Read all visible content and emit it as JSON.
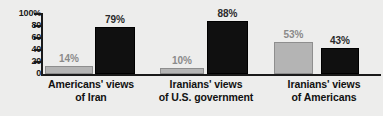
{
  "chart_data": {
    "type": "bar",
    "title": "",
    "subtitle": "",
    "xlabel": "",
    "ylabel": "",
    "ylim": [
      0,
      100
    ],
    "grid": false,
    "legend_position": "none",
    "categories": [
      "Americans' views\nof Iran",
      "Iranians' views\nof U.S. government",
      "Iranians' views\nof Americans"
    ],
    "series": [
      {
        "name": "favorable",
        "color": "#b4b4b4",
        "values": [
          14,
          10,
          53
        ],
        "labels": [
          "14%",
          "10%",
          "53%"
        ]
      },
      {
        "name": "unfavorable",
        "color": "#101010",
        "values": [
          79,
          88,
          43
        ],
        "labels": [
          "79%",
          "88%",
          "43%"
        ]
      }
    ],
    "y_ticks": [
      {
        "value": 100,
        "label": "100%"
      },
      {
        "value": 80,
        "label": "80"
      },
      {
        "value": 60,
        "label": "60"
      },
      {
        "value": 40,
        "label": "40"
      },
      {
        "value": 20,
        "label": "20"
      },
      {
        "value": 0,
        "label": "0"
      }
    ],
    "colors": {
      "background": "#ededec",
      "axis": "#1a1a1a",
      "light_bar": "#b4b4b4",
      "dark_bar": "#101010",
      "label_text": "#111111",
      "light_value_text": "#8a8a8a",
      "dark_value_text": "#2b2b2b"
    }
  }
}
